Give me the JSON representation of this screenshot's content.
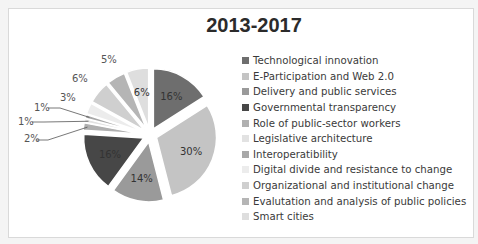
{
  "chart_data": {
    "type": "pie",
    "title": "2013-2017",
    "categories": [
      "Technological innovation",
      "E-Participation and Web 2.0",
      "Delivery and public services",
      "Governmental transparency",
      "Role of public-sector workers",
      "Legislative architecture",
      "Interoperatibility",
      "Digital divide and resistance to change",
      "Organizational and institutional change",
      "Evalutation and analysis of public policies",
      "Smart cities"
    ],
    "values": [
      16,
      30,
      14,
      16,
      2,
      1,
      1,
      3,
      6,
      5,
      6
    ],
    "labels": [
      "16%",
      "30%",
      "14%",
      "16%",
      "2%",
      "1%",
      "1%",
      "3%",
      "6%",
      "5%",
      "6%"
    ],
    "colors": [
      "#6e6e6e",
      "#c4c4c4",
      "#9a9a9a",
      "#474747",
      "#b0b0b0",
      "#e2e2e2",
      "#a8a8a8",
      "#ececec",
      "#cfcfcf",
      "#b5b5b5",
      "#dedede"
    ],
    "legend_position": "right",
    "exploded": true,
    "start_angle_deg": 0,
    "direction": "clockwise"
  }
}
